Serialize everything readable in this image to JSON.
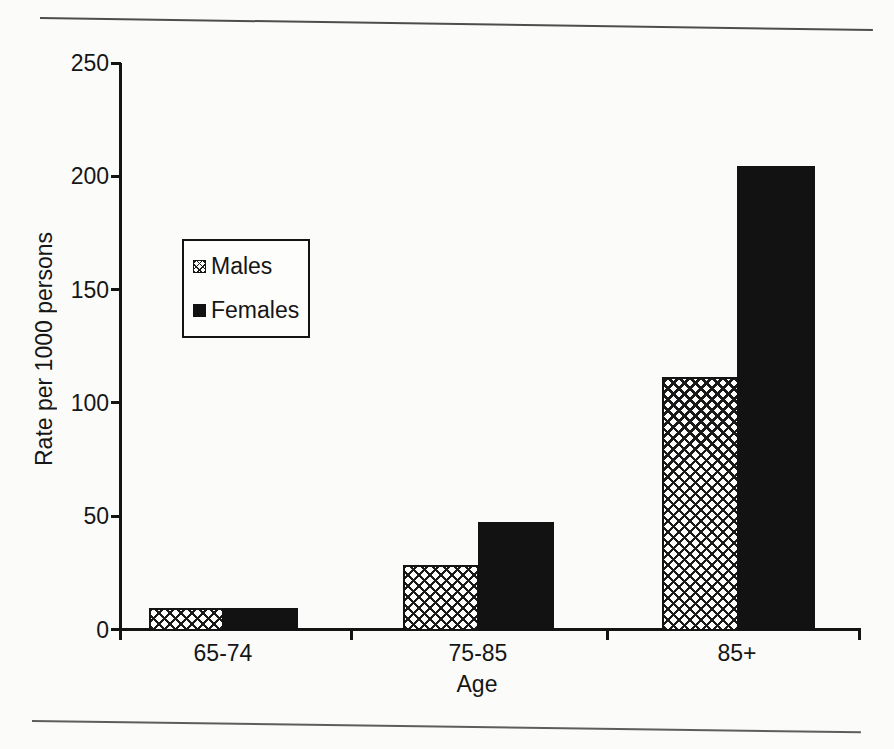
{
  "page": {
    "background": "#fbfbf9",
    "ink": "#141414"
  },
  "chart_data": {
    "type": "bar",
    "title": "",
    "categories": [
      "65-74",
      "75-85",
      "85+"
    ],
    "series": [
      {
        "name": "Males",
        "fill": "crosshatch",
        "color": "#141414",
        "values": [
          10,
          29,
          112
        ]
      },
      {
        "name": "Females",
        "fill": "solid",
        "color": "#121212",
        "values": [
          10,
          48,
          205
        ]
      }
    ],
    "xlabel": "Age",
    "ylabel": "Rate per 1000 persons",
    "ylim": [
      0,
      250
    ],
    "yticks": [
      0,
      50,
      100,
      150,
      200,
      250
    ],
    "grid": false,
    "legend_position": "upper-left-inside",
    "legend_entries": [
      "Males",
      "Females"
    ]
  }
}
